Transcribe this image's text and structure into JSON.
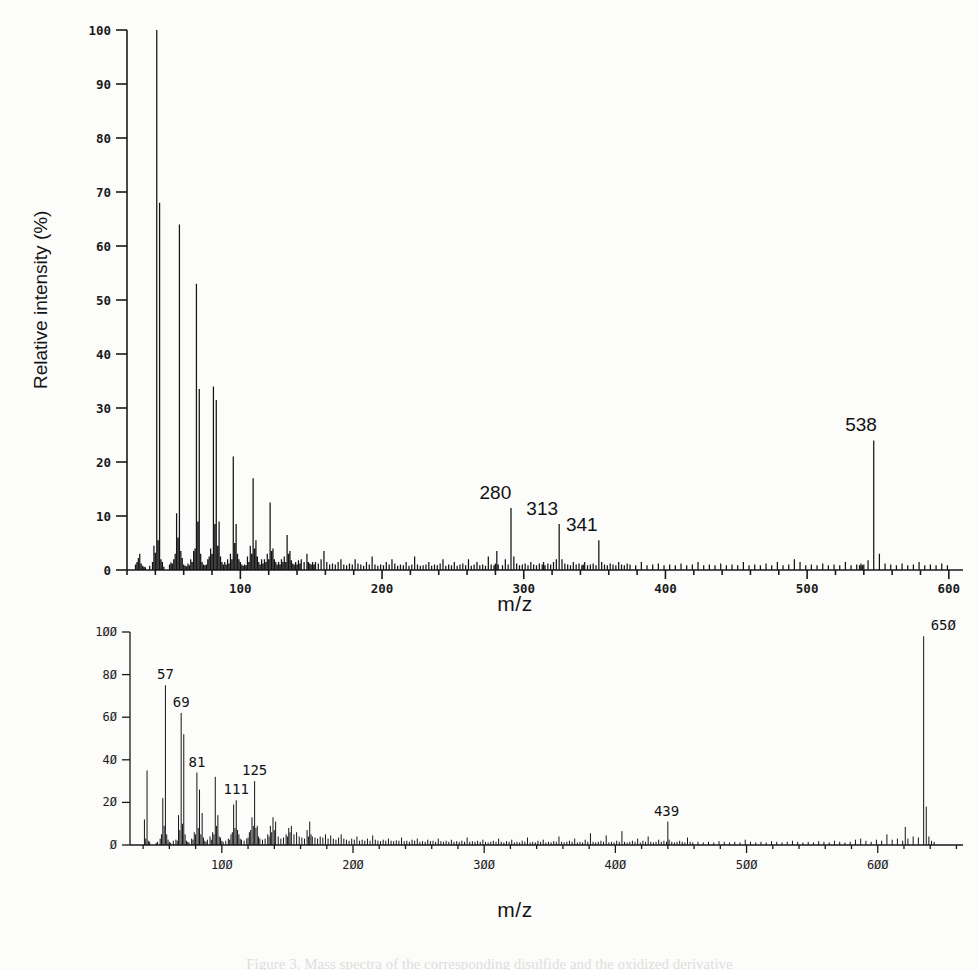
{
  "figure": {
    "caption": "Figure 3. Mass spectra of the corresponding disulfide and the oxidized derivative"
  },
  "chart_data": [
    {
      "id": "top",
      "type": "bar",
      "title": "",
      "xlabel": "m/z",
      "ylabel": "Relative intensity (%)",
      "xlim": [
        20,
        610
      ],
      "ylim": [
        0,
        100
      ],
      "xticks": [
        100,
        200,
        300,
        400,
        500,
        600
      ],
      "xtick_labels": [
        "100",
        "200",
        "300",
        "400",
        "500",
        "600"
      ],
      "yticks": [
        0,
        10,
        20,
        30,
        40,
        50,
        60,
        70,
        80,
        90,
        100
      ],
      "ytick_labels": [
        "0",
        "10",
        "20",
        "30",
        "40",
        "50",
        "60",
        "70",
        "80",
        "90",
        "100"
      ],
      "minor_xtick_step": 20,
      "grid": false,
      "legend": null,
      "annotations": [
        {
          "mz": 280,
          "label": "280",
          "intensity": 11.5
        },
        {
          "mz": 313,
          "label": "313",
          "intensity": 8.5
        },
        {
          "mz": 341,
          "label": "341",
          "intensity": 5.5
        },
        {
          "mz": 538,
          "label": "538",
          "intensity": 24.0
        }
      ],
      "x": [
        26,
        27,
        28,
        29,
        30,
        31,
        32,
        33,
        36,
        38,
        39,
        40,
        41,
        42,
        43,
        44,
        45,
        46,
        50,
        51,
        52,
        53,
        54,
        55,
        56,
        57,
        58,
        59,
        60,
        61,
        62,
        63,
        64,
        65,
        66,
        67,
        68,
        69,
        70,
        71,
        72,
        73,
        74,
        75,
        76,
        77,
        78,
        79,
        80,
        81,
        82,
        83,
        84,
        85,
        86,
        87,
        88,
        89,
        90,
        91,
        92,
        93,
        94,
        95,
        96,
        97,
        98,
        99,
        100,
        101,
        102,
        103,
        104,
        105,
        106,
        107,
        108,
        109,
        110,
        111,
        112,
        113,
        114,
        115,
        116,
        117,
        118,
        119,
        120,
        121,
        122,
        123,
        124,
        125,
        126,
        127,
        128,
        129,
        130,
        131,
        132,
        133,
        134,
        135,
        136,
        137,
        138,
        139,
        140,
        141,
        142,
        143,
        145,
        147,
        148,
        149,
        150,
        151,
        152,
        153,
        155,
        157,
        159,
        161,
        163,
        165,
        167,
        169,
        171,
        173,
        175,
        177,
        179,
        181,
        183,
        185,
        187,
        189,
        191,
        193,
        195,
        197,
        199,
        201,
        203,
        205,
        207,
        209,
        211,
        213,
        215,
        217,
        219,
        221,
        223,
        225,
        227,
        229,
        231,
        233,
        235,
        237,
        239,
        241,
        243,
        245,
        247,
        249,
        251,
        253,
        255,
        257,
        259,
        261,
        263,
        265,
        267,
        269,
        271,
        273,
        275,
        277,
        279,
        280,
        281,
        282,
        285,
        287,
        289,
        291,
        293,
        295,
        297,
        299,
        301,
        303,
        305,
        307,
        309,
        311,
        313,
        314,
        315,
        317,
        319,
        321,
        323,
        325,
        327,
        329,
        331,
        333,
        335,
        337,
        339,
        341,
        342,
        343,
        345,
        347,
        349,
        351,
        353,
        355,
        357,
        359,
        361,
        363,
        365,
        367,
        369,
        371,
        373,
        375,
        379,
        383,
        387,
        391,
        395,
        399,
        403,
        407,
        411,
        415,
        419,
        423,
        427,
        431,
        435,
        439,
        443,
        447,
        451,
        455,
        459,
        463,
        467,
        471,
        475,
        479,
        483,
        487,
        491,
        495,
        499,
        503,
        507,
        511,
        515,
        519,
        523,
        527,
        531,
        535,
        537,
        538,
        539,
        540,
        543,
        547,
        551,
        555,
        559,
        563,
        567,
        571,
        575,
        579,
        583,
        587,
        591,
        595,
        599
      ],
      "y": [
        1.0,
        1.5,
        2.2,
        3.0,
        1.2,
        0.8,
        0.6,
        0.5,
        0.8,
        1.5,
        4.5,
        3.2,
        100.0,
        5.5,
        68.0,
        2.0,
        1.5,
        0.6,
        1.0,
        1.4,
        1.2,
        2.0,
        3.0,
        10.5,
        6.0,
        64.0,
        3.5,
        2.2,
        1.0,
        0.8,
        0.7,
        1.2,
        0.9,
        2.0,
        1.5,
        3.5,
        4.0,
        53.0,
        9.0,
        33.5,
        3.0,
        1.5,
        1.0,
        0.9,
        1.0,
        2.0,
        2.5,
        4.0,
        3.0,
        34.0,
        8.5,
        31.5,
        4.5,
        9.0,
        2.5,
        1.5,
        1.0,
        1.5,
        1.0,
        2.0,
        1.2,
        3.0,
        2.0,
        21.0,
        5.0,
        8.5,
        3.0,
        2.0,
        1.5,
        1.0,
        0.8,
        1.0,
        0.9,
        2.5,
        1.5,
        4.5,
        3.0,
        17.0,
        4.0,
        5.5,
        2.5,
        1.5,
        1.0,
        2.0,
        1.2,
        2.0,
        1.5,
        3.0,
        2.0,
        12.5,
        3.5,
        4.0,
        2.0,
        1.5,
        1.0,
        1.5,
        1.0,
        2.0,
        1.5,
        2.5,
        1.5,
        6.5,
        3.0,
        3.5,
        1.8,
        1.2,
        1.0,
        1.5,
        1.0,
        1.8,
        1.2,
        2.0,
        1.5,
        3.0,
        1.5,
        1.2,
        1.0,
        1.5,
        1.0,
        1.5,
        1.2,
        2.0,
        3.5,
        1.5,
        1.0,
        1.2,
        1.0,
        1.5,
        2.0,
        1.0,
        0.9,
        1.2,
        1.0,
        2.0,
        1.2,
        1.0,
        0.8,
        1.5,
        1.0,
        2.5,
        1.0,
        0.8,
        1.0,
        0.9,
        1.5,
        1.0,
        2.0,
        1.2,
        0.8,
        1.0,
        0.9,
        1.5,
        0.8,
        1.0,
        2.5,
        1.0,
        0.8,
        0.9,
        1.0,
        1.5,
        0.8,
        1.0,
        0.9,
        1.2,
        2.0,
        0.8,
        1.0,
        0.9,
        1.5,
        0.8,
        1.0,
        1.2,
        0.9,
        2.0,
        0.8,
        1.0,
        1.5,
        0.9,
        1.0,
        0.8,
        2.5,
        1.0,
        0.9,
        1.2,
        3.5,
        1.0,
        0.9,
        2.0,
        1.0,
        11.5,
        2.5,
        1.2,
        0.9,
        1.0,
        1.2,
        0.9,
        1.5,
        1.0,
        0.9,
        1.2,
        1.0,
        1.5,
        0.9,
        1.2,
        1.0,
        1.5,
        2.0,
        8.5,
        2.0,
        1.2,
        1.0,
        0.9,
        1.5,
        1.0,
        1.2,
        0.9,
        1.0,
        1.5,
        0.9,
        1.0,
        1.2,
        0.9,
        5.5,
        1.5,
        1.0,
        0.9,
        1.2,
        1.0,
        0.9,
        1.5,
        1.0,
        0.9,
        1.2,
        1.0,
        0.9,
        1.5,
        0.9,
        1.0,
        1.2,
        0.9,
        1.0,
        0.9,
        1.2,
        0.9,
        1.0,
        1.5,
        0.9,
        1.0,
        0.9,
        1.2,
        0.9,
        1.0,
        0.9,
        1.5,
        0.9,
        1.0,
        0.9,
        1.2,
        0.9,
        1.5,
        0.9,
        1.0,
        2.0,
        1.5,
        0.9,
        1.0,
        0.9,
        1.2,
        0.9,
        1.0,
        0.9,
        1.5,
        0.9,
        1.0,
        0.9,
        1.2,
        0.9,
        1.0,
        1.8,
        24.0,
        3.0,
        1.2,
        1.0,
        0.9,
        1.2,
        0.9,
        1.0,
        1.5,
        0.9,
        1.0,
        0.9,
        1.2,
        0.9,
        1.0,
        0.9,
        1.2,
        0.9
      ]
    },
    {
      "id": "bottom",
      "type": "bar",
      "title": "",
      "xlabel": "m/z",
      "ylabel": "",
      "xlim": [
        30,
        665
      ],
      "ylim": [
        0,
        100
      ],
      "xticks": [
        100,
        200,
        300,
        400,
        500,
        600
      ],
      "xtick_labels": [
        "100",
        "200",
        "300",
        "400",
        "500",
        "600"
      ],
      "yticks": [
        0,
        20,
        40,
        60,
        80,
        100
      ],
      "ytick_labels": [
        "0",
        "20",
        "40",
        "60",
        "80",
        "100"
      ],
      "minor_xtick_step": 20,
      "grid": false,
      "legend": null,
      "annotations": [
        {
          "mz": 57,
          "label": "57",
          "intensity": 75.0
        },
        {
          "mz": 69,
          "label": "69",
          "intensity": 62.0
        },
        {
          "mz": 81,
          "label": "81",
          "intensity": 34.0
        },
        {
          "mz": 111,
          "label": "111",
          "intensity": 21.0
        },
        {
          "mz": 125,
          "label": "125",
          "intensity": 30.0
        },
        {
          "mz": 439,
          "label": "439",
          "intensity": 11.0
        },
        {
          "mz": 650,
          "label": "650",
          "intensity": 98.0
        }
      ],
      "x": [
        41,
        42,
        43,
        44,
        45,
        50,
        51,
        53,
        54,
        55,
        56,
        57,
        58,
        59,
        60,
        61,
        63,
        65,
        66,
        67,
        68,
        69,
        70,
        71,
        72,
        73,
        74,
        75,
        77,
        78,
        79,
        80,
        81,
        82,
        83,
        84,
        85,
        86,
        87,
        88,
        89,
        91,
        92,
        93,
        94,
        95,
        96,
        97,
        98,
        99,
        100,
        101,
        103,
        105,
        106,
        107,
        108,
        109,
        110,
        111,
        112,
        113,
        114,
        115,
        117,
        119,
        120,
        121,
        122,
        123,
        124,
        125,
        126,
        127,
        128,
        129,
        131,
        133,
        135,
        136,
        137,
        138,
        139,
        140,
        141,
        143,
        145,
        147,
        149,
        150,
        151,
        152,
        153,
        155,
        157,
        159,
        161,
        163,
        165,
        166,
        167,
        168,
        169,
        171,
        173,
        175,
        177,
        179,
        181,
        183,
        185,
        187,
        189,
        191,
        193,
        195,
        197,
        199,
        201,
        203,
        205,
        207,
        209,
        211,
        213,
        215,
        217,
        219,
        221,
        223,
        225,
        227,
        229,
        231,
        233,
        235,
        237,
        239,
        241,
        243,
        245,
        247,
        249,
        251,
        253,
        255,
        257,
        259,
        261,
        263,
        265,
        267,
        269,
        271,
        273,
        275,
        277,
        279,
        281,
        283,
        285,
        287,
        289,
        291,
        293,
        295,
        297,
        299,
        301,
        303,
        305,
        307,
        309,
        311,
        313,
        315,
        317,
        319,
        321,
        323,
        325,
        327,
        329,
        331,
        333,
        335,
        337,
        339,
        341,
        343,
        345,
        347,
        349,
        351,
        353,
        355,
        357,
        359,
        361,
        363,
        365,
        367,
        369,
        371,
        373,
        375,
        377,
        379,
        381,
        383,
        385,
        387,
        389,
        391,
        393,
        395,
        397,
        399,
        401,
        403,
        405,
        407,
        409,
        411,
        413,
        415,
        417,
        419,
        421,
        423,
        425,
        427,
        429,
        431,
        433,
        435,
        437,
        439,
        440,
        441,
        443,
        445,
        447,
        449,
        451,
        453,
        455,
        457,
        459,
        463,
        467,
        471,
        475,
        479,
        483,
        487,
        491,
        495,
        499,
        503,
        507,
        511,
        515,
        519,
        523,
        527,
        531,
        535,
        539,
        543,
        547,
        551,
        555,
        559,
        563,
        567,
        571,
        575,
        579,
        583,
        587,
        591,
        595,
        599,
        603,
        607,
        611,
        615,
        619,
        621,
        623,
        627,
        631,
        635,
        637,
        639,
        641,
        643,
        645,
        647,
        649,
        650,
        651,
        652,
        655,
        659
      ],
      "y": [
        12.0,
        3.0,
        35.0,
        2.0,
        1.5,
        1.0,
        1.5,
        3.0,
        5.0,
        22.0,
        9.0,
        75.0,
        5.0,
        2.5,
        1.5,
        1.0,
        2.0,
        2.5,
        2.0,
        14.0,
        7.0,
        62.0,
        10.0,
        52.0,
        5.0,
        2.0,
        1.5,
        1.2,
        3.0,
        2.5,
        6.0,
        5.0,
        34.0,
        8.0,
        26.0,
        5.0,
        15.0,
        3.5,
        2.0,
        1.5,
        2.5,
        4.0,
        2.5,
        6.0,
        5.0,
        32.0,
        9.0,
        14.0,
        4.0,
        3.5,
        2.0,
        1.5,
        2.0,
        3.0,
        2.5,
        5.0,
        6.0,
        19.0,
        8.0,
        21.0,
        7.0,
        5.0,
        3.0,
        2.5,
        2.0,
        3.0,
        3.5,
        6.0,
        7.0,
        13.0,
        9.0,
        30.0,
        8.0,
        9.0,
        4.0,
        3.0,
        2.5,
        3.0,
        5.0,
        4.0,
        9.0,
        6.0,
        13.0,
        7.0,
        11.0,
        4.0,
        3.0,
        3.5,
        5.0,
        4.0,
        8.0,
        6.0,
        9.0,
        5.0,
        6.0,
        4.0,
        3.5,
        3.0,
        7.0,
        4.0,
        11.0,
        5.0,
        4.0,
        3.5,
        3.0,
        4.0,
        3.5,
        5.0,
        3.0,
        4.5,
        3.0,
        2.5,
        3.5,
        5.0,
        3.0,
        2.5,
        2.0,
        3.0,
        2.5,
        4.0,
        2.0,
        2.5,
        2.0,
        3.0,
        2.0,
        4.5,
        2.5,
        2.0,
        1.8,
        2.5,
        2.0,
        3.0,
        2.0,
        1.8,
        2.2,
        2.0,
        3.5,
        1.8,
        2.0,
        1.5,
        2.5,
        2.0,
        3.0,
        1.5,
        1.8,
        1.5,
        2.5,
        1.8,
        2.0,
        1.5,
        3.0,
        1.8,
        1.5,
        2.0,
        1.5,
        2.5,
        1.5,
        1.8,
        1.5,
        2.0,
        1.5,
        3.5,
        1.5,
        1.8,
        1.5,
        2.0,
        1.5,
        2.5,
        1.5,
        1.2,
        1.5,
        2.0,
        1.5,
        3.0,
        1.5,
        1.2,
        1.8,
        1.5,
        2.5,
        1.2,
        1.5,
        1.2,
        2.0,
        1.5,
        3.5,
        1.2,
        1.5,
        1.2,
        2.0,
        1.5,
        2.5,
        1.2,
        1.5,
        1.2,
        1.8,
        1.5,
        4.0,
        1.5,
        1.2,
        1.5,
        2.0,
        1.5,
        3.0,
        1.2,
        1.5,
        1.2,
        2.5,
        1.5,
        5.5,
        1.5,
        1.2,
        1.5,
        2.0,
        1.5,
        4.5,
        1.2,
        1.5,
        1.2,
        2.0,
        1.5,
        6.5,
        1.5,
        1.2,
        1.5,
        2.0,
        1.5,
        3.0,
        1.2,
        2.0,
        1.5,
        4.0,
        1.5,
        1.2,
        1.5,
        2.5,
        1.5,
        2.0,
        1.5,
        11.0,
        2.5,
        1.5,
        1.2,
        1.5,
        2.0,
        1.5,
        1.2,
        3.5,
        1.5,
        1.2,
        1.5,
        1.2,
        1.5,
        1.2,
        1.8,
        1.5,
        1.2,
        1.5,
        1.2,
        2.5,
        1.5,
        1.2,
        1.5,
        1.2,
        1.8,
        1.5,
        1.2,
        1.5,
        2.0,
        1.5,
        1.2,
        1.5,
        1.2,
        1.8,
        1.5,
        1.2,
        2.0,
        1.5,
        1.2,
        1.5,
        2.5,
        3.0,
        2.0,
        1.5,
        2.5,
        2.0,
        5.0,
        2.5,
        3.0,
        2.0,
        8.5,
        3.0,
        4.0,
        3.5,
        98.0,
        18.0,
        4.0,
        2.0,
        1.5
      ]
    }
  ]
}
